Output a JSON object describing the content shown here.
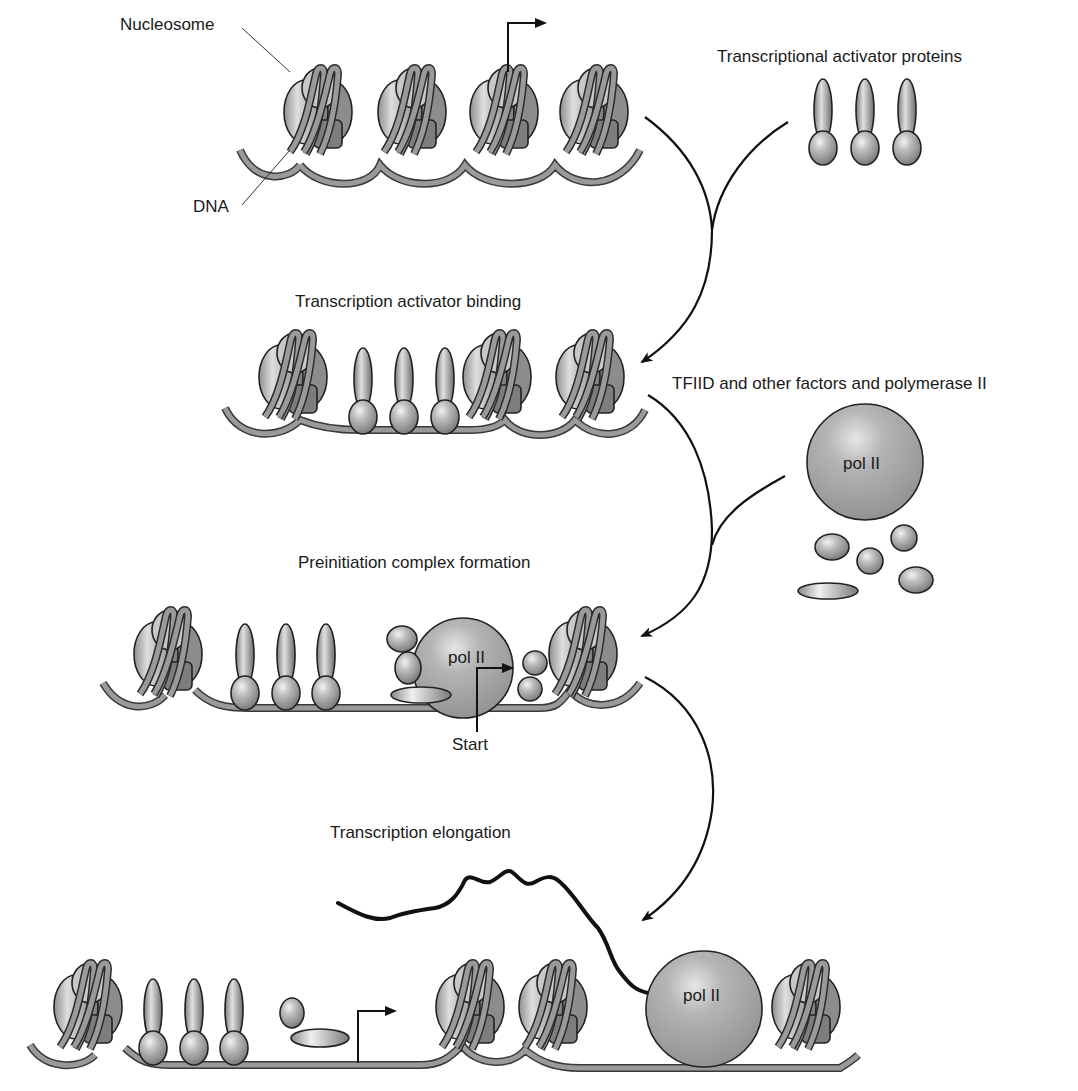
{
  "figure": {
    "colors": {
      "background": "#ffffff",
      "protein_fill": "#9c9c9c",
      "dna_fill": "#9a9a9a",
      "outline": "#222222",
      "arrow": "#111111"
    }
  },
  "labels": {
    "nucleosome": "Nucleosome",
    "dna": "DNA",
    "activators": "Transcriptional activator proteins",
    "stage2": "Transcription activator binding",
    "factors": "TFIID and other factors and polymerase II",
    "stage3": "Preinitiation complex formation",
    "start": "Start",
    "stage4": "Transcription elongation",
    "pol_free": "pol II",
    "pol_pic": "pol II",
    "pol_elong": "pol II"
  },
  "stages": [
    {
      "id": "chromatin",
      "nucleosomes": 4,
      "activators_bound": 0
    },
    {
      "id": "activator-binding",
      "nucleosomes": 4,
      "activators_bound": 3
    },
    {
      "id": "preinitiation-complex",
      "nucleosomes": 2,
      "activators_bound": 3,
      "polymerase": "pol II"
    },
    {
      "id": "elongation",
      "nucleosomes": 4,
      "activators_bound": 3,
      "polymerase": "pol II",
      "transcript": "RNA"
    }
  ]
}
